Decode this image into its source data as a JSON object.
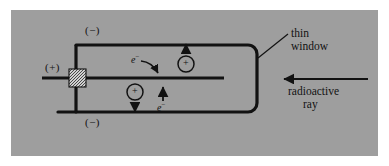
{
  "figure": {
    "background_color": "#ffffff",
    "panel_color": "#9e9e9e",
    "ink_color": "#121212"
  },
  "labels": {
    "cathode_top": "(−)",
    "cathode_bottom": "(−)",
    "anode": "(+)",
    "thin_window_line1": "thin",
    "thin_window_line2": "window",
    "radioactive_line1": "radioactive",
    "radioactive_line2": "ray",
    "electron_upper": "e",
    "electron_upper_sup": "−",
    "electron_lower": "e",
    "electron_lower_sup": "−",
    "ion_upper": "+",
    "ion_lower": "+"
  },
  "parts": {
    "chamber": "rounded-rectangle-chamber",
    "anode_wire": "central-anode-electrode",
    "insulator": "insulator-seal-box",
    "window": "thin-window-right-wall",
    "incoming_ray": "radioactive-ray-arrow",
    "leader": "thin-window-leader-line"
  }
}
